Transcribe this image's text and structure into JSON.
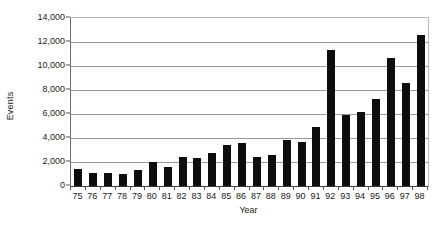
{
  "chart_data": {
    "type": "bar",
    "title": "",
    "xlabel": "Year",
    "ylabel": "Events",
    "categories": [
      "75",
      "76",
      "77",
      "78",
      "79",
      "80",
      "81",
      "82",
      "83",
      "84",
      "85",
      "86",
      "87",
      "88",
      "89",
      "90",
      "91",
      "92",
      "93",
      "94",
      "95",
      "96",
      "97",
      "98"
    ],
    "values": [
      1400,
      1100,
      1100,
      1000,
      1350,
      2000,
      1550,
      2400,
      2350,
      2750,
      3400,
      3550,
      2450,
      2550,
      3800,
      3700,
      4900,
      11350,
      5900,
      6150,
      7250,
      10700,
      8550,
      12550
    ],
    "ylim": [
      0,
      14000
    ],
    "ytick_values": [
      0,
      2000,
      4000,
      6000,
      8000,
      10000,
      12000,
      14000
    ],
    "ytick_labels": [
      "0",
      "2,000",
      "4,000",
      "6,000",
      "8,000",
      "10,000",
      "12,000",
      "14,000"
    ],
    "grid": true,
    "grid_axis": "y",
    "legend": null,
    "bar_color": "#0d0d0d",
    "background_color": "#ffffff"
  }
}
